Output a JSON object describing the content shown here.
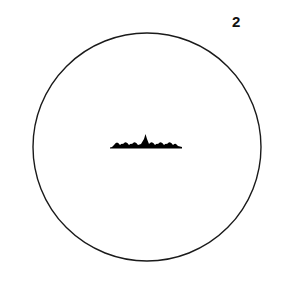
{
  "figure": {
    "label": "2",
    "circle": {
      "cx": 147,
      "cy": 147,
      "r": 114,
      "stroke": "#1a1a1a"
    },
    "waveform": {
      "description": "horizontal baseline with row of small rounded peaks and a taller central spike",
      "baseline_y": 147,
      "x_start": 110,
      "x_end": 182,
      "small_peaks": 8,
      "central_peak": 1,
      "fill": "#000000"
    }
  }
}
